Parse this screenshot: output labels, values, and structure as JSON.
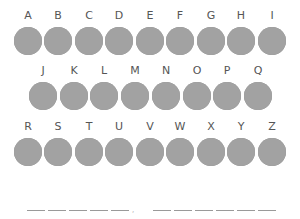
{
  "keyboard": {
    "circle_color": "#a2a2a2",
    "label_color": "#555555",
    "rows": [
      {
        "letters": [
          "A",
          "B",
          "C",
          "D",
          "E",
          "F",
          "G",
          "H",
          "I"
        ]
      },
      {
        "letters": [
          "J",
          "K",
          "L",
          "M",
          "N",
          "O",
          "P",
          "Q"
        ]
      },
      {
        "letters": [
          "R",
          "S",
          "T",
          "U",
          "V",
          "W",
          "X",
          "Y",
          "Z"
        ]
      }
    ]
  },
  "answer": {
    "word1_blanks": 5,
    "separator": ",",
    "word2_blanks": 6
  }
}
